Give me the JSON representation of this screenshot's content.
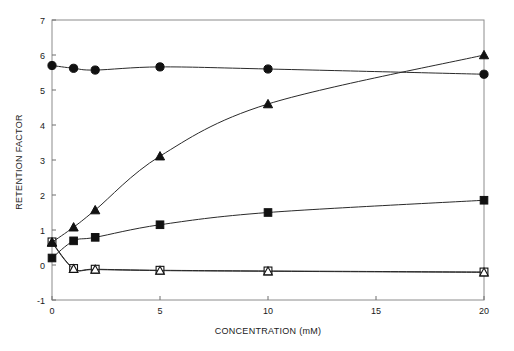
{
  "chart_data": {
    "type": "line",
    "title": "",
    "xlabel": "CONCENTRATION  (mM)",
    "ylabel": "RETENTION FACTOR",
    "xlim": [
      0,
      20
    ],
    "ylim": [
      -1,
      7
    ],
    "xticks": [
      0,
      5,
      10,
      15,
      20
    ],
    "yticks": [
      -1,
      0,
      1,
      2,
      3,
      4,
      5,
      6,
      7
    ],
    "xtick_labels": [
      "0",
      "5",
      "10",
      "15",
      "20"
    ],
    "ytick_labels": [
      "-1",
      "0",
      "1",
      "2",
      "3",
      "4",
      "5",
      "6",
      "7"
    ],
    "grid": false,
    "legend": "none",
    "x": [
      0,
      1,
      2,
      5,
      10,
      20
    ],
    "series": [
      {
        "name": "filled-circle-series",
        "marker": "filled-circle",
        "values": [
          5.7,
          5.62,
          5.57,
          5.66,
          5.6,
          5.45
        ]
      },
      {
        "name": "filled-triangle-series",
        "marker": "filled-triangle",
        "values": [
          0.65,
          1.08,
          1.57,
          3.11,
          4.6,
          6.0
        ]
      },
      {
        "name": "filled-square-series",
        "marker": "filled-square",
        "values": [
          0.2,
          0.69,
          0.79,
          1.15,
          1.5,
          1.85
        ]
      },
      {
        "name": "open-square-series",
        "marker": "open-square",
        "values": [
          0.66,
          -0.1,
          -0.12,
          -0.15,
          -0.17,
          -0.2
        ]
      },
      {
        "name": "open-triangle-series",
        "marker": "open-triangle",
        "values": [
          0.64,
          -0.11,
          -0.13,
          -0.16,
          -0.18,
          -0.21
        ]
      }
    ]
  },
  "colors": {
    "frame": "#8c8c8c",
    "line": "#2a2a2a",
    "marker_fill": "#111111",
    "marker_open_fill": "#ffffff",
    "text": "#1a1a1a",
    "background": "#ffffff"
  }
}
